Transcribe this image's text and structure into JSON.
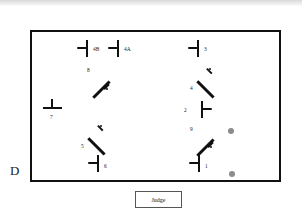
{
  "diagram": {
    "outside_label": "D",
    "judge_box": {
      "label": "Judge"
    },
    "arena": {
      "border_color": "#111111",
      "fill_color": "#ffffff"
    },
    "marker_color": "#111111",
    "circle_color": "#8c8c8c",
    "markers": [
      {
        "id": "4B",
        "label": "4B",
        "kind": "vertical-bar",
        "tick": "left",
        "x": 55,
        "y": 16,
        "label_dx": 6,
        "label_dy": -2
      },
      {
        "id": "4A",
        "label": "4A",
        "kind": "vertical-bar",
        "tick": "left",
        "x": 86,
        "y": 16,
        "label_dx": 6,
        "label_dy": -2
      },
      {
        "id": "3",
        "label": "3",
        "kind": "vertical-bar",
        "tick": "left",
        "x": 166,
        "y": 16,
        "label_dx": 6,
        "label_dy": -2
      },
      {
        "id": "8",
        "label": "8",
        "kind": "diagonal-bar",
        "tick": "lower-right",
        "x": 68,
        "y": 46,
        "label_dx": -13,
        "label_dy": -11
      },
      {
        "id": "4",
        "label": "4",
        "kind": "diagonal-bar",
        "tick": "upper-right",
        "x": 172,
        "y": 46,
        "label_dx": -14,
        "label_dy": 7
      },
      {
        "id": "7",
        "label": "7",
        "kind": "horizontal-bar",
        "tick": "top",
        "x": 20,
        "y": 76,
        "label_dx": -2,
        "label_dy": 6
      },
      {
        "id": "2",
        "label": "2",
        "kind": "vertical-bar",
        "tick": "right",
        "x": 170,
        "y": 77,
        "label_dx": -18,
        "label_dy": -2
      },
      {
        "id": "5",
        "label": "5",
        "kind": "diagonal-bar",
        "tick": "upper-right",
        "x": 63,
        "y": 103,
        "label_dx": -14,
        "label_dy": 8
      },
      {
        "id": "9",
        "label": "9",
        "kind": "diagonal-bar",
        "tick": "lower-right",
        "x": 172,
        "y": 104,
        "label_dx": -14,
        "label_dy": -10
      },
      {
        "id": "6",
        "label": "6",
        "kind": "vertical-bar",
        "tick": "left",
        "x": 66,
        "y": 131,
        "label_dx": 6,
        "label_dy": 0
      },
      {
        "id": "1",
        "label": "1",
        "kind": "vertical-bar",
        "tick": "left",
        "x": 167,
        "y": 131,
        "label_dx": 6,
        "label_dy": 0
      }
    ],
    "circles": [
      {
        "id": "circle-top",
        "x": 196,
        "y": 96
      },
      {
        "id": "circle-bottom",
        "x": 197,
        "y": 139
      }
    ]
  }
}
